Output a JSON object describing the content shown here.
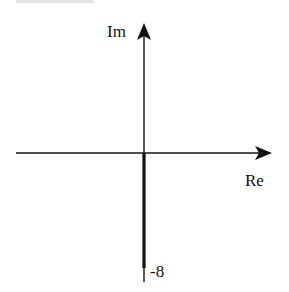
{
  "diagram": {
    "type": "complex-plane root locus sketch",
    "axes": {
      "imaginary_label": "Im",
      "real_label": "Re"
    },
    "annotations": {
      "point_label": "-8"
    },
    "colors": {
      "axis": "#111111",
      "background": "#ffffff"
    }
  }
}
